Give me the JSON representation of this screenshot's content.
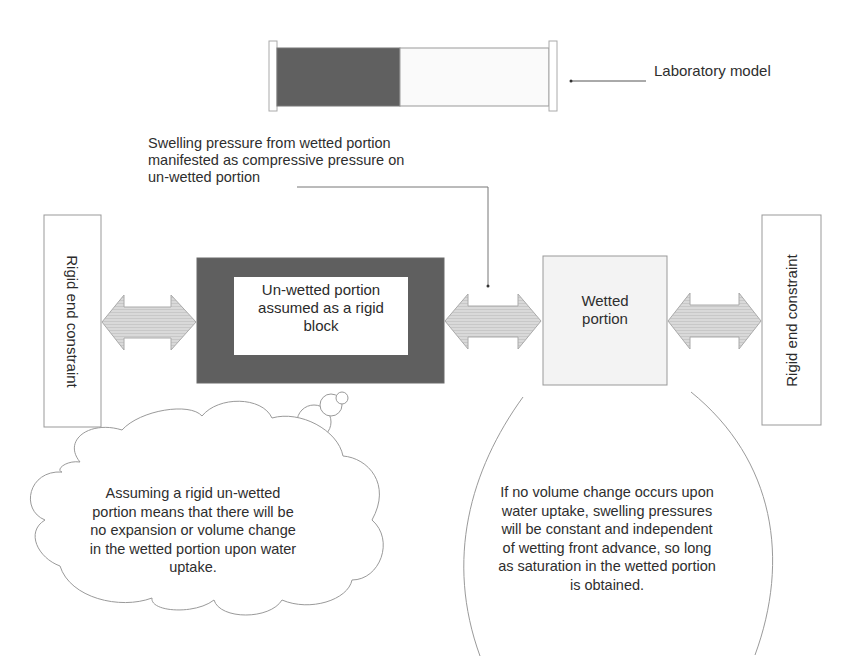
{
  "colors": {
    "background": "#ffffff",
    "dark_fill": "#5f5f5f",
    "light_fill": "#f4f4f4",
    "arrow_fill": "#d6d6d6",
    "outline": "#9a9a9a",
    "text": "#2e2e2e"
  },
  "laboratory_model": {
    "label": "Laboratory model",
    "unwetted_fraction": 0.43
  },
  "annotation": {
    "swelling_pressure": "Swelling pressure from wetted portion\nmanifested as compressive pressure on\nun-wetted portion"
  },
  "blocks": {
    "left_constraint": "Rigid end\nconstraint",
    "unwetted": "Un-wetted portion\nassumed as a rigid\nblock",
    "wetted": "Wetted\nportion",
    "right_constraint": "Rigid end\nconstraint"
  },
  "arrows": [
    {
      "name": "left-double-arrow",
      "type": "double-headed"
    },
    {
      "name": "middle-double-arrow",
      "type": "double-headed"
    },
    {
      "name": "right-double-arrow",
      "type": "double-headed"
    }
  ],
  "callouts": {
    "thought_cloud": "Assuming a rigid un-wetted\nportion means that there will be\nno expansion or volume change\nin the wetted portion upon water\nuptake.",
    "drop_note": "If no volume change occurs upon\nwater uptake, swelling pressures\nwill be constant and independent\nof  wetting front advance, so long\nas saturation in the wetted portion\nis obtained."
  }
}
